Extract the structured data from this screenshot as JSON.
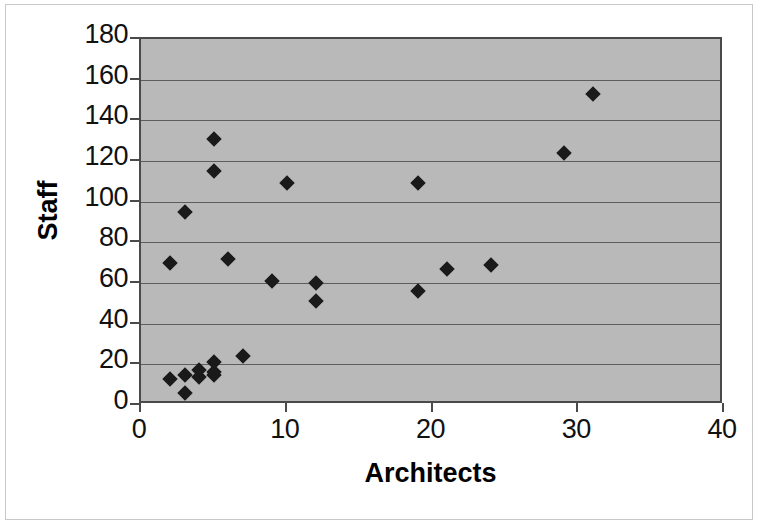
{
  "figure": {
    "background_color": "#ffffff",
    "plot_background_color": "#b9b9b9",
    "axis_color": "#4a4a4a",
    "gridline_color": "#5d5d5d",
    "marker_color": "#1a1a1a",
    "border_color": "#c8c8c8"
  },
  "chart_data": {
    "type": "scatter",
    "title": "",
    "xlabel": "Architects",
    "ylabel": "Staff",
    "xlim": [
      0,
      40
    ],
    "ylim": [
      0,
      180
    ],
    "xticks": [
      0,
      10,
      20,
      30,
      40
    ],
    "yticks": [
      0,
      20,
      40,
      60,
      80,
      100,
      120,
      140,
      160,
      180
    ],
    "xtick_labels": [
      "0",
      "10",
      "20",
      "30",
      "40"
    ],
    "ytick_labels": [
      "0",
      "20",
      "40",
      "60",
      "80",
      "100",
      "120",
      "140",
      "160",
      "180"
    ],
    "grid": "horizontal",
    "legend": "none",
    "marker_shape": "diamond",
    "series": [
      {
        "name": "Firms",
        "points": [
          {
            "x": 2,
            "y": 13
          },
          {
            "x": 2,
            "y": 70
          },
          {
            "x": 3,
            "y": 6
          },
          {
            "x": 3,
            "y": 15
          },
          {
            "x": 3,
            "y": 95
          },
          {
            "x": 4,
            "y": 14
          },
          {
            "x": 4,
            "y": 17
          },
          {
            "x": 5,
            "y": 15
          },
          {
            "x": 5,
            "y": 16
          },
          {
            "x": 5,
            "y": 21
          },
          {
            "x": 5,
            "y": 115
          },
          {
            "x": 5,
            "y": 131
          },
          {
            "x": 6,
            "y": 72
          },
          {
            "x": 7,
            "y": 24
          },
          {
            "x": 9,
            "y": 61
          },
          {
            "x": 10,
            "y": 109
          },
          {
            "x": 12,
            "y": 51
          },
          {
            "x": 12,
            "y": 60
          },
          {
            "x": 19,
            "y": 56
          },
          {
            "x": 19,
            "y": 109
          },
          {
            "x": 21,
            "y": 67
          },
          {
            "x": 24,
            "y": 69
          },
          {
            "x": 29,
            "y": 124
          },
          {
            "x": 31,
            "y": 153
          }
        ]
      }
    ]
  }
}
